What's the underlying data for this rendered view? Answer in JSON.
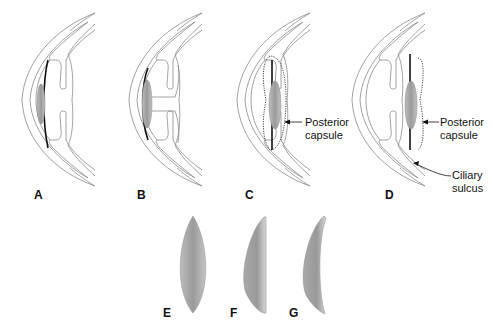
{
  "figure": {
    "panels": [
      {
        "id": "A",
        "label": "A",
        "description": "Eye cross-section with anterior chamber lens"
      },
      {
        "id": "B",
        "label": "B",
        "description": "Eye cross-section with iris-fixated lens"
      },
      {
        "id": "C",
        "label": "C",
        "description": "Eye cross-section with lens in capsular bag"
      },
      {
        "id": "D",
        "label": "D",
        "description": "Eye cross-section with lens in ciliary sulcus"
      },
      {
        "id": "E",
        "label": "E",
        "description": "Biconvex lens profile"
      },
      {
        "id": "F",
        "label": "F",
        "description": "Plano-convex lens profile"
      },
      {
        "id": "G",
        "label": "G",
        "description": "Meniscus lens profile"
      }
    ],
    "annotations": {
      "c_posterior_capsule_line1": "Posterior",
      "c_posterior_capsule_line2": "capsule",
      "d_posterior_capsule_line1": "Posterior",
      "d_posterior_capsule_line2": "capsule",
      "d_ciliary_sulcus_line1": "Ciliary",
      "d_ciliary_sulcus_line2": "sulcus"
    },
    "colors": {
      "outline": "#8a8a8a",
      "lens_fill_light": "#c8c8c8",
      "lens_fill_dark": "#8e8e8e",
      "haptic": "#111111"
    }
  }
}
